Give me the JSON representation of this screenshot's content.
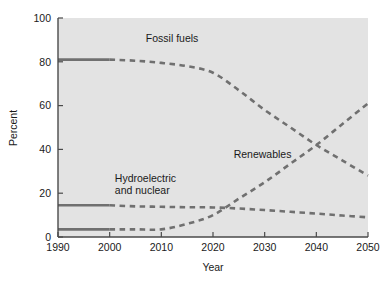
{
  "chart_data": {
    "type": "line",
    "title": "",
    "xlabel": "Year",
    "ylabel": "Percent",
    "xlim": [
      1990,
      2050
    ],
    "ylim": [
      0,
      100
    ],
    "xticks": [
      1990,
      2000,
      2010,
      2020,
      2030,
      2040,
      2050
    ],
    "xtick_labels": [
      "1990",
      "2000",
      "2010",
      "2020",
      "2030",
      "2040",
      "2050"
    ],
    "yticks": [
      0,
      20,
      40,
      60,
      80,
      100
    ],
    "ytick_labels": [
      "0",
      "20",
      "40",
      "60",
      "80",
      "100"
    ],
    "grid": false,
    "legend_position": "inline-annotations",
    "plot_background_color": "#e3e3e3",
    "figure_background_color": "#ffffff",
    "line_color": "#707070",
    "axis_color": "#4a4a4a",
    "historical_style": "solid",
    "projected_style": "dashed",
    "historical_end_year": 2000,
    "x": [
      1990,
      1995,
      2000,
      2005,
      2010,
      2015,
      2020,
      2025,
      2030,
      2035,
      2040,
      2045,
      2050
    ],
    "series": [
      {
        "name": "Fossil fuels",
        "label": "Fossil fuels",
        "values": [
          81,
          81,
          81,
          80.5,
          79.5,
          78,
          75,
          67,
          58,
          50,
          42,
          35,
          28
        ],
        "label_x": 2007,
        "label_y": 89
      },
      {
        "name": "Renewables",
        "label": "Renewables",
        "values": [
          3.5,
          3.5,
          3.5,
          3.5,
          3.5,
          6,
          10,
          17.5,
          25,
          33.5,
          42,
          51.5,
          61
        ],
        "label_x": 2024,
        "label_y": 36
      },
      {
        "name": "Hydroelectric and nuclear",
        "label": "Hydroelectric\nand nuclear",
        "label_line1": "Hydroelectric",
        "label_line2": "and nuclear",
        "values": [
          14.5,
          14.5,
          14.5,
          14,
          13.8,
          13.6,
          13.5,
          13,
          12.3,
          11.5,
          10.7,
          9.8,
          9
        ],
        "label_x": 2001,
        "label_y": 25
      }
    ],
    "annotations": [
      {
        "text": "Fossil fuels",
        "series": "Fossil fuels"
      },
      {
        "text": "Renewables",
        "series": "Renewables"
      },
      {
        "text": "Hydroelectric",
        "series": "Hydroelectric and nuclear"
      },
      {
        "text": "and nuclear",
        "series": "Hydroelectric and nuclear"
      }
    ]
  }
}
